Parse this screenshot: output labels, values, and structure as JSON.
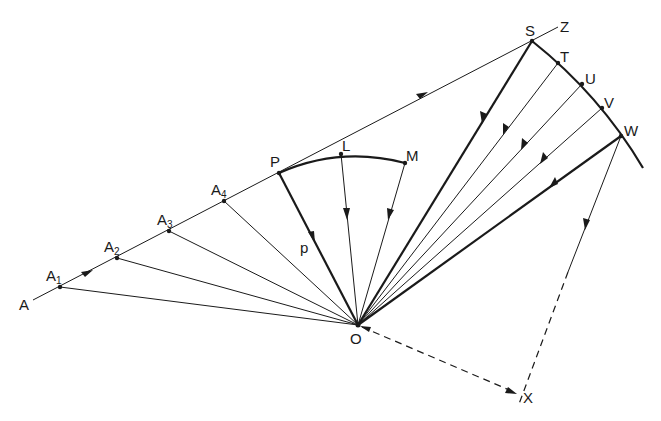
{
  "diagram": {
    "title": "",
    "colors": {
      "ink": "#1a1a1a",
      "background": "#ffffff"
    },
    "labels": {
      "A": "A",
      "A1": "A",
      "A1_sub": "1",
      "A2": "A",
      "A2_sub": "2",
      "A3": "A",
      "A3_sub": "3",
      "A4": "A",
      "A4_sub": "4",
      "P": "P",
      "L": "L",
      "M": "M",
      "p": "p",
      "S": "S",
      "Z": "Z",
      "T": "T",
      "U": "U",
      "V": "V",
      "W": "W",
      "O": "O",
      "X": "X"
    },
    "points": {
      "A_start": [
        33,
        300
      ],
      "A1": [
        60,
        287
      ],
      "A2": [
        117,
        258
      ],
      "A3": [
        169,
        231
      ],
      "A4": [
        224,
        201
      ],
      "P": [
        279,
        173
      ],
      "L": [
        341,
        154
      ],
      "M": [
        405,
        163
      ],
      "S": [
        532,
        41
      ],
      "Z": [
        558,
        27
      ],
      "T": [
        558,
        63
      ],
      "U": [
        582,
        84
      ],
      "V": [
        602,
        108
      ],
      "W": [
        621,
        136
      ],
      "arc_end": [
        643,
        168
      ],
      "O": [
        358,
        325
      ],
      "X": [
        519,
        397
      ]
    },
    "edges": [
      {
        "from": "A_start",
        "to": "Z",
        "style": "thin",
        "arrows": [
          "forward@A1-A2",
          "forward@mid-PS"
        ]
      },
      {
        "from": "A1",
        "to": "O",
        "style": "thin"
      },
      {
        "from": "A2",
        "to": "O",
        "style": "thin"
      },
      {
        "from": "A3",
        "to": "O",
        "style": "thin"
      },
      {
        "from": "A4",
        "to": "O",
        "style": "thin"
      },
      {
        "from": "P",
        "to": "O",
        "style": "thick",
        "arrow": "toward O",
        "label": "p"
      },
      {
        "from": "L",
        "to": "O",
        "style": "thin",
        "arrow": "toward O"
      },
      {
        "from": "M",
        "to": "O",
        "style": "thin",
        "arrow": "toward O"
      },
      {
        "from": "S",
        "to": "O",
        "style": "thick",
        "arrow": "toward O"
      },
      {
        "from": "T",
        "to": "O",
        "style": "thin",
        "arrow": "toward O"
      },
      {
        "from": "U",
        "to": "O",
        "style": "thin",
        "arrow": "toward O"
      },
      {
        "from": "V",
        "to": "O",
        "style": "thin",
        "arrow": "toward O"
      },
      {
        "from": "W",
        "to": "O",
        "style": "thick",
        "arrow": "toward O"
      },
      {
        "from": "W",
        "to": "X",
        "style": "thin then dashed",
        "arrow": "toward X"
      },
      {
        "from": "O",
        "to": "X",
        "style": "dashed",
        "arrows": [
          "at O",
          "at X"
        ]
      }
    ],
    "arcs": [
      {
        "through": [
          "P",
          "L",
          "M"
        ],
        "style": "thick"
      },
      {
        "through": [
          "S",
          "T",
          "U",
          "V",
          "W",
          "arc_end"
        ],
        "style": "thick"
      }
    ]
  }
}
